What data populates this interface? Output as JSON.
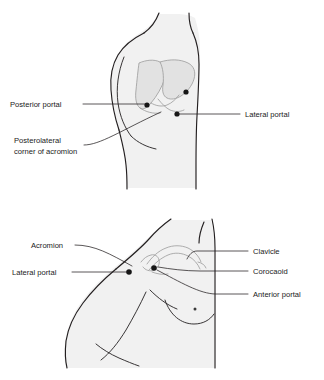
{
  "figure": {
    "panels": [
      {
        "id": "posterior-view",
        "view_name": "Posterior shoulder view",
        "labels": [
          {
            "key": "posterior_portal",
            "text": "Posterior portal",
            "side": "left",
            "lines": [
              "Posterior portal"
            ]
          },
          {
            "key": "posterolateral_corner",
            "text": "Posterolateral corner of acromion",
            "side": "left",
            "lines": [
              "Posterolateral",
              "corner of acromion"
            ]
          },
          {
            "key": "lateral_portal",
            "text": "Lateral portal",
            "side": "right",
            "lines": [
              "Lateral portal"
            ]
          }
        ],
        "markers": [
          {
            "key": "posterior_portal_dot",
            "name": "posterior-portal-marker"
          },
          {
            "key": "accessory_dot",
            "name": "accessory-portal-marker"
          },
          {
            "key": "lateral_portal_dot",
            "name": "lateral-portal-marker"
          }
        ]
      },
      {
        "id": "anterior-view",
        "view_name": "Anterior shoulder view",
        "labels": [
          {
            "key": "acromion",
            "text": "Acromion",
            "side": "left",
            "lines": [
              "Acromion"
            ]
          },
          {
            "key": "lateral_portal_2",
            "text": "Lateral portal",
            "side": "left",
            "lines": [
              "Lateral portal"
            ]
          },
          {
            "key": "clavicle",
            "text": "Clavicle",
            "side": "right",
            "lines": [
              "Clavicle"
            ]
          },
          {
            "key": "coracoid",
            "text": "Corocaoid",
            "side": "right",
            "lines": [
              "Corocaoid"
            ]
          },
          {
            "key": "anterior_portal",
            "text": "Anterior portal",
            "side": "right",
            "lines": [
              "Anterior portal"
            ]
          }
        ],
        "markers": [
          {
            "key": "lateral_portal_dot_2",
            "name": "lateral-portal-marker"
          },
          {
            "key": "anterior_portal_dot",
            "name": "anterior-portal-marker"
          },
          {
            "key": "nipple_dot",
            "name": "nipple-marker"
          }
        ]
      }
    ],
    "colors": {
      "skin_fill": "#f1f1f1",
      "outline": "#231f20",
      "bone_fill": "#e2e2e2",
      "bone_stroke": "#9a9a9a",
      "marker": "#161616",
      "text": "#1a1a1a",
      "background": "#ffffff"
    }
  }
}
